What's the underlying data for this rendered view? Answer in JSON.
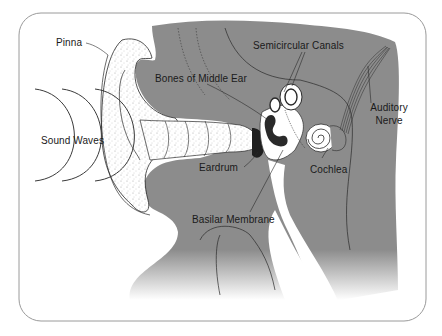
{
  "diagram": {
    "colors": {
      "background": "#ffffff",
      "frame": "#9a9a9a",
      "head_tissue": "#8c8c8c",
      "outline": "#2a2a2a",
      "text": "#1a1a1a"
    },
    "labels": {
      "pinna": "Pinna",
      "sound_waves": "Sound Waves",
      "bones_of_middle_ear": "Bones of Middle Ear",
      "semicircular_canals": "Semicircular Canals",
      "auditory_nerve_line1": "Auditory",
      "auditory_nerve_line2": "Nerve",
      "eardrum": "Eardrum",
      "cochlea": "Cochlea",
      "basilar_membrane": "Basilar Membrane"
    }
  }
}
